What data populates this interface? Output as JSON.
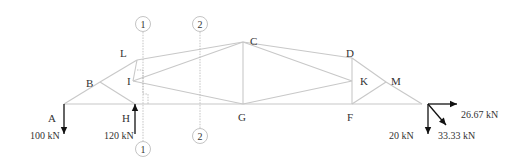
{
  "diagram": {
    "type": "truss",
    "nodes": [
      {
        "id": "A",
        "label": "A",
        "x": 64,
        "y": 104,
        "lx": 48,
        "ly": 122
      },
      {
        "id": "B",
        "label": "B",
        "x": 100,
        "y": 82,
        "lx": 86,
        "ly": 87
      },
      {
        "id": "L",
        "label": "L",
        "x": 137,
        "y": 60,
        "lx": 120,
        "ly": 57
      },
      {
        "id": "C",
        "label": "C",
        "x": 243,
        "y": 42,
        "lx": 250,
        "ly": 45
      },
      {
        "id": "D",
        "label": "D",
        "x": 352,
        "y": 58,
        "lx": 346,
        "ly": 57
      },
      {
        "id": "M",
        "label": "M",
        "x": 386,
        "y": 82,
        "lx": 391,
        "ly": 85
      },
      {
        "id": "R",
        "label": "",
        "x": 422,
        "y": 104
      },
      {
        "id": "I",
        "label": "I",
        "x": 133,
        "y": 81,
        "lx": 127,
        "ly": 85
      },
      {
        "id": "K",
        "label": "K",
        "x": 352,
        "y": 81,
        "lx": 360,
        "ly": 85
      },
      {
        "id": "H",
        "label": "H",
        "x": 135,
        "y": 104,
        "lx": 122,
        "ly": 122
      },
      {
        "id": "G",
        "label": "G",
        "x": 243,
        "y": 104,
        "lx": 238,
        "ly": 121
      },
      {
        "id": "F",
        "label": "F",
        "x": 352,
        "y": 104,
        "lx": 347,
        "ly": 121
      }
    ],
    "members": [
      [
        "A",
        "B"
      ],
      [
        "B",
        "L"
      ],
      [
        "L",
        "C"
      ],
      [
        "C",
        "D"
      ],
      [
        "D",
        "M"
      ],
      [
        "M",
        "R"
      ],
      [
        "A",
        "R"
      ],
      [
        "B",
        "H"
      ],
      [
        "L",
        "I"
      ],
      [
        "I",
        "C"
      ],
      [
        "I",
        "G"
      ],
      [
        "C",
        "G"
      ],
      [
        "C",
        "K"
      ],
      [
        "G",
        "K"
      ],
      [
        "D",
        "F"
      ],
      [
        "F",
        "M"
      ]
    ],
    "sections": [
      {
        "label": "1",
        "x": 143,
        "top_y": 24,
        "bottom_y": 149
      },
      {
        "label": "2",
        "x": 200,
        "top_y": 24,
        "bottom_y": 136
      }
    ],
    "loads": [
      {
        "id": "load-A",
        "label": "100 kN",
        "direction": "down",
        "x": 64,
        "y1": 104,
        "y2": 134,
        "lx": 30,
        "ly": 139
      },
      {
        "id": "reaction-H",
        "label": "120 kN",
        "direction": "up",
        "x": 135,
        "y1": 134,
        "y2": 104,
        "lx": 104,
        "ly": 139
      },
      {
        "id": "load-R-resultant",
        "label": "33.33 kN",
        "direction": "diagonal",
        "x1": 428,
        "y1": 104,
        "x2": 446,
        "y2": 125,
        "lx": 438,
        "ly": 139
      },
      {
        "id": "load-R-horizontal",
        "label": "26.67 kN",
        "direction": "right",
        "x1": 428,
        "y1": 104,
        "x2": 457,
        "y2": 104,
        "lx": 461,
        "ly": 118
      },
      {
        "id": "load-R-vertical",
        "label": "20 kN",
        "direction": "down",
        "x": 428,
        "y1": 104,
        "y2": 134,
        "lx": 389,
        "ly": 139
      }
    ],
    "colors": {
      "member": "#c8c8c8",
      "section": "#b4b4b4",
      "force": "#111111",
      "text": "#333333"
    }
  }
}
